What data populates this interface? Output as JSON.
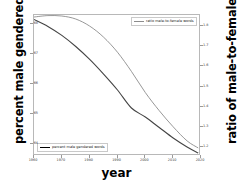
{
  "chart_data": {
    "type": "line",
    "title": "",
    "xlabel": "year",
    "ylabel": "percent male gendered words",
    "ylabel_right": "ratio of male-to-female words",
    "grid": false,
    "legend_position": "split (top-right and bottom-left)",
    "xlim": [
      1960,
      2020
    ],
    "xticks": [
      1960,
      1970,
      1980,
      1990,
      2000,
      2010,
      2020
    ],
    "xticklabels": [
      "1960",
      "1970",
      "1980",
      "1990",
      "2000",
      "2010",
      "2020"
    ],
    "ylim": [
      63.6,
      68.3
    ],
    "yticks": [
      68,
      67,
      66,
      65,
      64
    ],
    "yticklabels": [
      "68",
      "67",
      "66",
      "65",
      "64"
    ],
    "ylim_right": [
      1.155,
      1.855
    ],
    "yticks_right": [
      1.8,
      1.7,
      1.6,
      1.5,
      1.4,
      1.3,
      1.2
    ],
    "yticklabels_right": [
      "1.8",
      "1.7",
      "1.6",
      "1.5",
      "1.4",
      "1.3",
      "1.2"
    ],
    "x": [
      1960,
      1965,
      1970,
      1975,
      1980,
      1985,
      1990,
      1995,
      2000,
      2005,
      2010,
      2015,
      2019
    ],
    "series": [
      {
        "name": "percent male gendered words",
        "axis": "left",
        "color": "#444444",
        "values": [
          68.15,
          67.92,
          67.62,
          67.25,
          66.82,
          66.33,
          65.8,
          65.2,
          64.9,
          64.55,
          64.2,
          63.9,
          63.7
        ]
      },
      {
        "name": "ratio male-to-female words",
        "axis": "right",
        "color": "#8c8c8c",
        "values": [
          1.845,
          1.852,
          1.85,
          1.835,
          1.8,
          1.745,
          1.67,
          1.575,
          1.47,
          1.38,
          1.3,
          1.23,
          1.195
        ]
      }
    ]
  },
  "legend": {
    "ratio_label": "ratio male-to-female words",
    "percent_label": "percent male gendered words"
  },
  "colors": {
    "percent_series": "#444444",
    "ratio_series": "#8c8c8c",
    "frame": "#b8b8b8",
    "text": "#000000",
    "tick_text": "#3a3a3a"
  }
}
